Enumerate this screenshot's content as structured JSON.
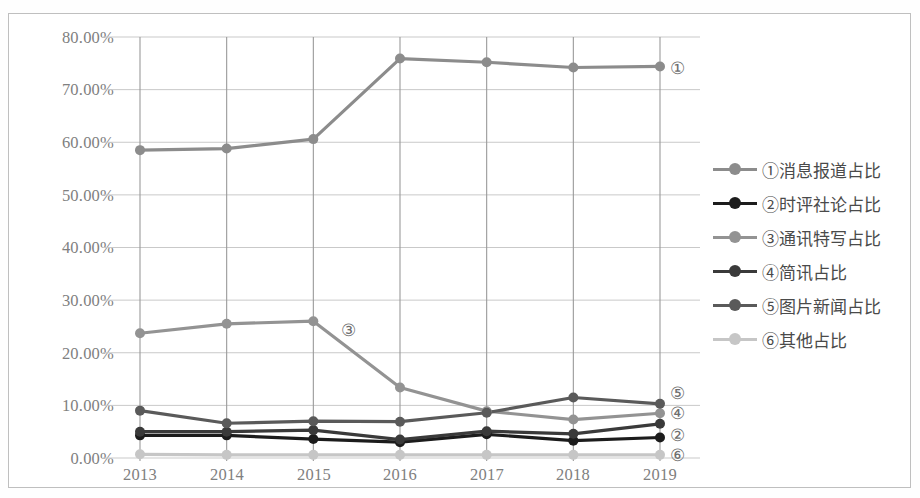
{
  "chart_data": {
    "type": "line",
    "title": "",
    "subtitle": "",
    "xlabel": "",
    "ylabel": "",
    "categories": [
      "2013",
      "2014",
      "2015",
      "2016",
      "2017",
      "2018",
      "2019"
    ],
    "x_tick_labels": [
      "2013",
      "2014",
      "2015",
      "2016",
      "2017",
      "2018",
      "2019"
    ],
    "y_tick_labels": [
      "0.00%",
      "10.00%",
      "20.00%",
      "30.00%",
      "40.00%",
      "50.00%",
      "60.00%",
      "70.00%",
      "80.00%"
    ],
    "y_tick_values": [
      0,
      10,
      20,
      30,
      40,
      50,
      60,
      70,
      80
    ],
    "ylim": [
      0,
      80
    ],
    "y_unit": "%",
    "grid": true,
    "grid_axis": "both",
    "legend_position": "right",
    "series": [
      {
        "key": "s1",
        "marker_label": "①",
        "name": "①消息报道占比",
        "color": "#8c8c8c",
        "values": [
          58.5,
          58.8,
          60.6,
          75.9,
          75.2,
          74.2,
          74.4
        ],
        "end_tag": "①"
      },
      {
        "key": "s2",
        "marker_label": "②",
        "name": "②时评社论占比",
        "color": "#1c1c1c",
        "values": [
          4.3,
          4.3,
          3.6,
          3.0,
          4.5,
          3.3,
          3.9
        ],
        "end_tag": "②"
      },
      {
        "key": "s3",
        "marker_label": "③",
        "name": "③通讯特写占比",
        "color": "#939393",
        "values": [
          23.7,
          25.5,
          26.0,
          13.4,
          8.9,
          7.3,
          8.5
        ],
        "end_tag": "③"
      },
      {
        "key": "s4",
        "marker_label": "④",
        "name": "④简讯占比",
        "color": "#3a3a3a",
        "values": [
          5.0,
          5.0,
          5.3,
          3.5,
          5.1,
          4.6,
          6.5
        ],
        "end_tag": "④"
      },
      {
        "key": "s5",
        "marker_label": "⑤",
        "name": "⑤图片新闻占比",
        "color": "#5a5a5a",
        "values": [
          9.0,
          6.6,
          7.0,
          6.9,
          8.6,
          11.5,
          10.3
        ],
        "end_tag": "⑤"
      },
      {
        "key": "s6",
        "marker_label": "⑥",
        "name": "⑥其他占比",
        "color": "#c6c6c6",
        "values": [
          0.7,
          0.6,
          0.6,
          0.6,
          0.6,
          0.6,
          0.6
        ],
        "end_tag": "⑥"
      }
    ],
    "annotations": [
      {
        "text": "③",
        "x_category": "2015",
        "y_value": 24.5,
        "note": "inline label beside series 3 descent"
      }
    ],
    "end_labels": [
      {
        "text": "①",
        "series": "s1"
      },
      {
        "text": "⑤",
        "series": "s5"
      },
      {
        "text": "④",
        "series": "s4"
      },
      {
        "text": "②",
        "series": "s2"
      },
      {
        "text": "⑥",
        "series": "s6"
      }
    ]
  },
  "legend": {
    "items": [
      {
        "label": "①消息报道占比",
        "color": "#8c8c8c"
      },
      {
        "label": "②时评社论占比",
        "color": "#1c1c1c"
      },
      {
        "label": "③通讯特写占比",
        "color": "#939393"
      },
      {
        "label": "④简讯占比",
        "color": "#3a3a3a"
      },
      {
        "label": "⑤图片新闻占比",
        "color": "#5a5a5a"
      },
      {
        "label": "⑥其他占比",
        "color": "#c6c6c6"
      }
    ]
  },
  "style": {
    "frame_border": "#bfbfbf",
    "gridline_color": "#c9c9c9",
    "vertical_gridline_color": "#9a9a9a",
    "tick_text_color": "#808080",
    "legend_text_color": "#4a4a4a",
    "background": "#ffffff"
  }
}
